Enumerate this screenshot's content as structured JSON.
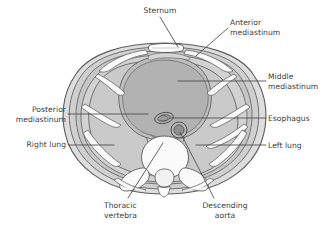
{
  "figure": {
    "view": "axial cross-section at the level of a thoracic vertebra",
    "background_color": "#ffffff",
    "palette": {
      "lung_fill": "#c9c9c9",
      "mediastinum_fill": "#b2b2b2",
      "chest_wall_fill": "#d8d8d8",
      "muscle_fill": "#c4c4c4",
      "bone_fill": "#fdfdfd",
      "outline": "#595959",
      "leader_line": "#4a4a4a",
      "text": "#3a3a3c"
    }
  },
  "labels": [
    {
      "id": "sternum",
      "text": "Sternum",
      "align": "center",
      "x": 128,
      "y": 6,
      "width": 64,
      "leader": [
        [
          160,
          17
        ],
        [
          178,
          47
        ]
      ]
    },
    {
      "id": "anterior-mediastinum",
      "text": "Anterior\nmediastinum",
      "align": "left",
      "x": 230,
      "y": 18,
      "width": 70,
      "leader": [
        [
          228,
          28
        ],
        [
          196,
          56
        ]
      ]
    },
    {
      "id": "middle-mediastinum",
      "text": "Middle\nmediastinum",
      "align": "left",
      "x": 268,
      "y": 72,
      "width": 62,
      "leader": [
        [
          266,
          81
        ],
        [
          178,
          81
        ]
      ]
    },
    {
      "id": "esophagus",
      "text": "Esophagus",
      "align": "left",
      "x": 268,
      "y": 114,
      "width": 58,
      "leader": [
        [
          266,
          118
        ],
        [
          170,
          118
        ]
      ]
    },
    {
      "id": "left-lung",
      "text": "Left lung",
      "align": "left",
      "x": 268,
      "y": 141,
      "width": 58,
      "leader": [
        [
          266,
          145
        ],
        [
          196,
          145
        ]
      ]
    },
    {
      "id": "posterior-mediastinum",
      "text": "Posterior\nmediastinum",
      "align": "right",
      "x": 0,
      "y": 105,
      "width": 66,
      "leader": [
        [
          68,
          114
        ],
        [
          148,
          114
        ]
      ]
    },
    {
      "id": "right-lung",
      "text": "Right lung",
      "align": "right",
      "x": 0,
      "y": 140,
      "width": 66,
      "leader": [
        [
          68,
          145
        ],
        [
          114,
          145
        ]
      ]
    },
    {
      "id": "thoracic-vertebra",
      "text": "Thoracic\nvertebra",
      "align": "left",
      "x": 104,
      "y": 201,
      "width": 60,
      "leader": [
        [
          128,
          198
        ],
        [
          163,
          143
        ]
      ]
    },
    {
      "id": "descending-aorta",
      "text": "Descending\naorta",
      "align": "center",
      "x": 190,
      "y": 201,
      "width": 70,
      "leader": [
        [
          214,
          198
        ],
        [
          180,
          132
        ]
      ]
    }
  ],
  "anatomy": [
    {
      "id": "chest-wall",
      "name": "Thoracic wall"
    },
    {
      "id": "ribs",
      "name": "Ribs and intercostal muscles"
    },
    {
      "id": "sternum-body",
      "name": "Sternum"
    },
    {
      "id": "right-lung-body",
      "name": "Right lung"
    },
    {
      "id": "left-lung-body",
      "name": "Left lung"
    },
    {
      "id": "middle-mediastinum-body",
      "name": "Middle mediastinum (heart and pericardium)"
    },
    {
      "id": "anterior-mediastinum-body",
      "name": "Anterior mediastinum"
    },
    {
      "id": "posterior-mediastinum-body",
      "name": "Posterior mediastinum"
    },
    {
      "id": "esophagus-body",
      "name": "Esophagus"
    },
    {
      "id": "descending-aorta-body",
      "name": "Descending aorta"
    },
    {
      "id": "thoracic-vertebra-body",
      "name": "Thoracic vertebra"
    },
    {
      "id": "spinal-canal",
      "name": "Vertebral canal"
    }
  ]
}
